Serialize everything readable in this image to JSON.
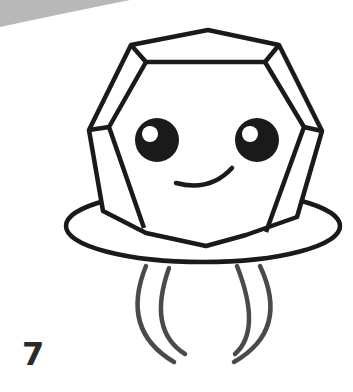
{
  "step": {
    "number": "7"
  },
  "drawing": {
    "subject": "cute gem ring with face",
    "colors": {
      "outline": "#1a1a1a",
      "band": "#4a4a4a",
      "page_curl": "#b8b8b8",
      "background": "#ffffff"
    }
  }
}
